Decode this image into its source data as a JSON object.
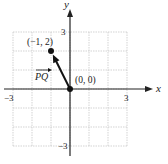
{
  "chart_data": {
    "type": "scatter",
    "title": "",
    "xlabel": "x",
    "ylabel": "y",
    "xlim": [
      -3,
      3
    ],
    "ylim": [
      -3,
      3
    ],
    "grid": true,
    "x_ticks": [
      {
        "value": -3,
        "label": "−3"
      },
      {
        "value": 3,
        "label": "3"
      }
    ],
    "y_ticks": [
      {
        "value": 3,
        "label": "3"
      },
      {
        "value": -3,
        "label": "−3"
      }
    ],
    "points": [
      {
        "x": -1,
        "y": 2,
        "label": "(−1, 2)"
      },
      {
        "x": 0,
        "y": 0,
        "label": "(0, 0)"
      }
    ],
    "vector": {
      "from": [
        0,
        0
      ],
      "to": [
        -1,
        2
      ],
      "label": "PQ",
      "has_over_arrow": true
    },
    "colors": {
      "grid": "#c8c8c8",
      "axis": "#222222",
      "ink": "#111111"
    }
  }
}
